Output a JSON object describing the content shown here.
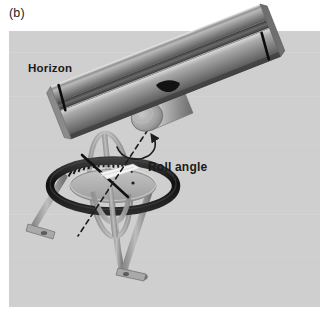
{
  "figure": {
    "panel_label": "(b)",
    "caption_labels": {
      "horizon": "Horizon",
      "roll_angle": "Roll angle"
    },
    "background": {
      "page_color": "#ffffff",
      "panel_color": "#cfcfcf",
      "panel_rect": {
        "x": 9,
        "y": 31,
        "width": 311,
        "height": 276
      }
    },
    "palette": {
      "panel_gray": "#cfcfcf",
      "bar_light": "#e6e6e6",
      "bar_mid": "#9a9a9a",
      "bar_dark": "#4e4e4e",
      "bar_darkest": "#2b2b2b",
      "ring_black": "#1b1b1b",
      "disc_gray": "#b3b3b3",
      "leg_gray": "#9e9e9e",
      "leg_shadow": "#7d7d7d",
      "gimbal_gray": "#a8a8a8",
      "needle_black": "#111111",
      "tick_black": "#141414",
      "highlight_white": "#f2f2f2",
      "text_color": "#1a1a1a"
    },
    "objects": [
      {
        "name": "horizon-bar",
        "description": "long tilted prismatic horizon bar with open channel groove"
      },
      {
        "name": "horizon-bar-index-left",
        "description": "black index tick on left end of bar"
      },
      {
        "name": "horizon-bar-index-right",
        "description": "black index tick on right end of bar"
      },
      {
        "name": "pivot-cylinder",
        "description": "cylindrical pivot hub hanging below horizon bar"
      },
      {
        "name": "pivot-hole",
        "description": "dark elliptical hole on bar surface at hub"
      },
      {
        "name": "roll-axis-dashed-line",
        "description": "dashed axis line through hub down to gimbal"
      },
      {
        "name": "roll-rotation-arc-arrow",
        "description": "curved arrow around roll axis"
      },
      {
        "name": "outer-ring",
        "description": "thick black horizontal gimbal ring"
      },
      {
        "name": "inner-disc",
        "description": "gray inner disc / dial face"
      },
      {
        "name": "graduation-ticks",
        "description": "fan of radial scale tick marks along inner rim"
      },
      {
        "name": "vertical-gimbal-ring",
        "description": "gray vertical gimbal loop"
      },
      {
        "name": "pointer-needle",
        "description": "dark needle pointing at scale"
      },
      {
        "name": "pointer-vane",
        "description": "white pointer vane"
      },
      {
        "name": "tripod-leg-left",
        "description": "left tripod leg with footplate"
      },
      {
        "name": "tripod-leg-right",
        "description": "right tripod leg with footplate"
      },
      {
        "name": "tripod-leg-back",
        "description": "rear tripod leg"
      }
    ]
  }
}
